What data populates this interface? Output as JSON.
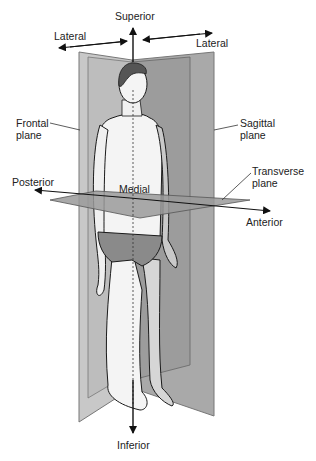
{
  "figure": {
    "labels": {
      "superior": "Superior",
      "inferior": "Inferior",
      "lateral_left": "Lateral",
      "lateral_right": "Lateral",
      "frontal_plane_line1": "Frontal",
      "frontal_plane_line2": "plane",
      "sagittal_plane_line1": "Sagittal",
      "sagittal_plane_line2": "plane",
      "transverse_plane_line1": "Transverse",
      "transverse_plane_line2": "plane",
      "posterior": "Posterior",
      "anterior": "Anterior",
      "medial": "Medial"
    },
    "colors": {
      "frontal_plane": "#c4c4c4",
      "sagittal_plane": "#a8a8a8",
      "transverse_plane": "#9a9a9a",
      "figure_skin": "#f4f4f4",
      "hair": "#555555",
      "briefs": "#8a8a8a",
      "outline": "#1a1a1a",
      "arrow": "#111111"
    }
  }
}
